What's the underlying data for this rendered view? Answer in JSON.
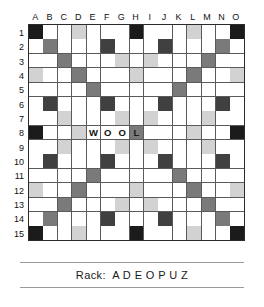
{
  "board": {
    "title": "Scrabble Board",
    "size": 15,
    "column_labels": [
      "A",
      "B",
      "C",
      "D",
      "E",
      "F",
      "G",
      "H",
      "I",
      "J",
      "K",
      "L",
      "M",
      "N",
      "O"
    ],
    "row_labels": [
      "1",
      "2",
      "3",
      "4",
      "5",
      "6",
      "7",
      "8",
      "9",
      "10",
      "11",
      "12",
      "13",
      "14",
      "15"
    ],
    "legend": {
      "triple_word": "#1b1b1b",
      "double_word": "#7a7a7a",
      "triple_letter": "#404040",
      "double_letter": "#d2d2d2",
      "plain": "#ffffff"
    },
    "premium_layout": [
      [
        "tw",
        "",
        "",
        "dl",
        "",
        "",
        "",
        "tw",
        "",
        "",
        "",
        "dl",
        "",
        "",
        "tw"
      ],
      [
        "",
        "dw",
        "",
        "",
        "",
        "tl",
        "",
        "",
        "",
        "tl",
        "",
        "",
        "",
        "dw",
        ""
      ],
      [
        "",
        "",
        "dw",
        "",
        "",
        "",
        "dl",
        "",
        "dl",
        "",
        "",
        "",
        "dw",
        "",
        ""
      ],
      [
        "dl",
        "",
        "",
        "dw",
        "",
        "",
        "",
        "dl",
        "",
        "",
        "",
        "dw",
        "",
        "",
        "dl"
      ],
      [
        "",
        "",
        "",
        "",
        "dw",
        "",
        "",
        "",
        "",
        "",
        "dw",
        "",
        "",
        "",
        ""
      ],
      [
        "",
        "tl",
        "",
        "",
        "",
        "tl",
        "",
        "",
        "",
        "tl",
        "",
        "",
        "",
        "tl",
        ""
      ],
      [
        "",
        "",
        "dl",
        "",
        "",
        "",
        "dl",
        "",
        "dl",
        "",
        "",
        "",
        "dl",
        "",
        ""
      ],
      [
        "tw",
        "",
        "",
        "dl",
        "",
        "",
        "",
        "dw",
        "",
        "",
        "",
        "dl",
        "",
        "",
        "tw"
      ],
      [
        "",
        "",
        "dl",
        "",
        "",
        "",
        "dl",
        "",
        "dl",
        "",
        "",
        "",
        "dl",
        "",
        ""
      ],
      [
        "",
        "tl",
        "",
        "",
        "",
        "tl",
        "",
        "",
        "",
        "tl",
        "",
        "",
        "",
        "tl",
        ""
      ],
      [
        "",
        "",
        "",
        "",
        "dw",
        "",
        "",
        "",
        "",
        "",
        "dw",
        "",
        "",
        "",
        ""
      ],
      [
        "dl",
        "",
        "",
        "dw",
        "",
        "",
        "",
        "dl",
        "",
        "",
        "",
        "dw",
        "",
        "",
        "dl"
      ],
      [
        "",
        "",
        "dw",
        "",
        "",
        "",
        "dl",
        "",
        "dl",
        "",
        "",
        "",
        "dw",
        "",
        ""
      ],
      [
        "",
        "dw",
        "",
        "",
        "",
        "tl",
        "",
        "",
        "",
        "tl",
        "",
        "",
        "",
        "dw",
        ""
      ],
      [
        "tw",
        "",
        "",
        "dl",
        "",
        "",
        "",
        "tw",
        "",
        "",
        "",
        "dl",
        "",
        "",
        "tw"
      ]
    ],
    "tiles": [
      {
        "row": 8,
        "col": "E",
        "col_index": 4,
        "letter": "W"
      },
      {
        "row": 8,
        "col": "F",
        "col_index": 5,
        "letter": "O"
      },
      {
        "row": 8,
        "col": "G",
        "col_index": 6,
        "letter": "O"
      },
      {
        "row": 8,
        "col": "H",
        "col_index": 7,
        "letter": "L"
      }
    ],
    "words_on_board": [
      "WOOL"
    ]
  },
  "rack": {
    "label": "Rack:",
    "letters": [
      "A",
      "D",
      "E",
      "O",
      "P",
      "U",
      "Z"
    ],
    "text": "Rack:  A D E O P U Z"
  }
}
